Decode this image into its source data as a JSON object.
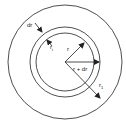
{
  "diagram": {
    "title": "",
    "labels": {
      "dr": "dr",
      "r": "r",
      "r_plus_dr": "r + dr",
      "r1_main": "r",
      "r1_sub": "1",
      "ri_main": "r",
      "ri_sub": "i"
    },
    "circles": [
      {
        "name": "outer",
        "radius": 57
      },
      {
        "name": "shell-outer",
        "radius": 35
      },
      {
        "name": "shell-inner",
        "radius": 29
      }
    ],
    "colors": {
      "stroke": "#222222",
      "background": "#ffffff"
    }
  }
}
